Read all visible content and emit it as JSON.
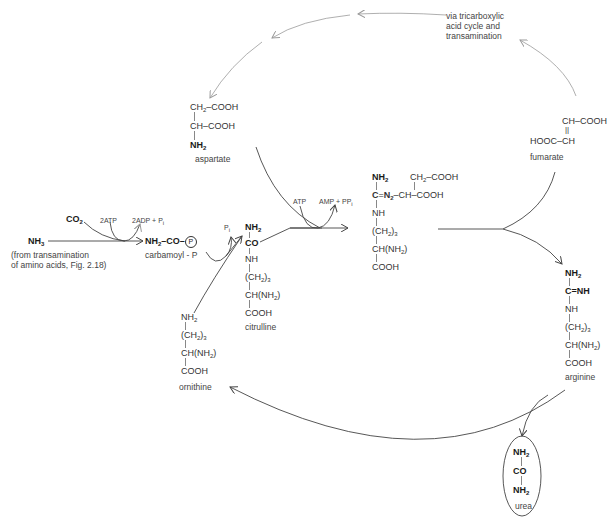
{
  "diagram": {
    "inputs": {
      "nh3": "NH3",
      "nh3_note_line1": "(from transamination",
      "nh3_note_line2": "of amino acids, Fig. 2.18)",
      "co2": "CO2",
      "atp2": "2ATP",
      "adp2_pi": "2ADP + Pi"
    },
    "carbamoyl_p": {
      "formula": "NH2–CO–(P)",
      "label": "carbamoyl - P",
      "pi": "Pi"
    },
    "aspartate": {
      "rows": [
        "CH2–COOH",
        "CH–COOH",
        "NH2"
      ],
      "label": "aspartate"
    },
    "citrulline": {
      "rows": [
        "NH2",
        "CO",
        "NH",
        "(CH2)3",
        "CH(NH2)",
        "COOH"
      ],
      "label": "citrulline"
    },
    "argininosuccinate": {
      "rows": [
        "NH2",
        "C=N2–CH–COOH",
        "NH",
        "(CH2)3",
        "CH(NH2)",
        "COOH"
      ],
      "branch": "CH2–COOH",
      "atp": "ATP",
      "amp_ppi": "AMP + PPi"
    },
    "fumarate": {
      "rows": [
        "CH–COOH",
        "||",
        "HOOC–CH"
      ],
      "label": "fumarate"
    },
    "tca_note": [
      "via tricarboxylic",
      "acid cycle and",
      "transamination"
    ],
    "arginine": {
      "rows": [
        "NH2",
        "C=NH",
        "NH",
        "(CH2)3",
        "CH(NH2)",
        "COOH"
      ],
      "label": "arginine"
    },
    "ornithine": {
      "rows": [
        "NH2",
        "(CH2)3",
        "CH(NH2)",
        "COOH"
      ],
      "label": "ornithine"
    },
    "urea": {
      "rows": [
        "NH2",
        "CO",
        "NH2"
      ],
      "label": "urea"
    },
    "colors": {
      "line": "#444444",
      "dotted": "#9a9a9a",
      "text": "#333333"
    }
  }
}
